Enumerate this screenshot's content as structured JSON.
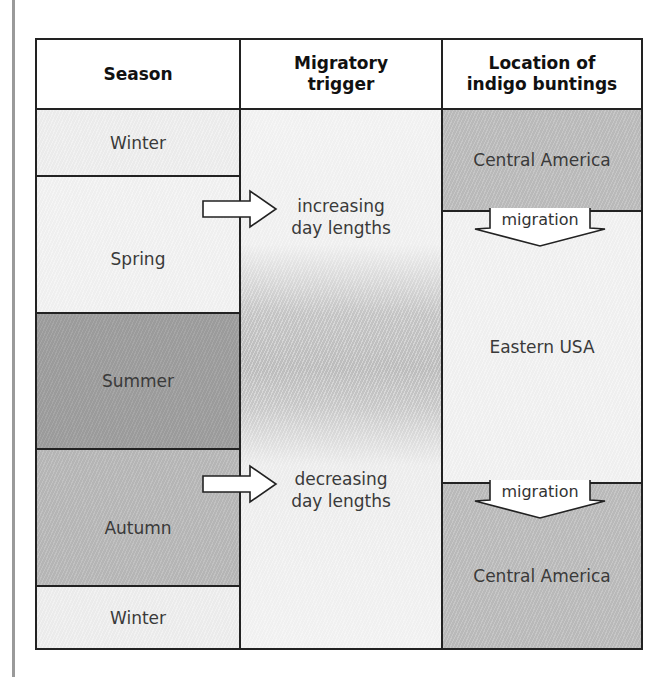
{
  "table": {
    "headers": [
      "Season",
      "Migratory trigger",
      "Location of indigo buntings"
    ],
    "header_lines": {
      "season": [
        "Season"
      ],
      "trigger": [
        "Migratory",
        "trigger"
      ],
      "location": [
        "Location of",
        "indigo buntings"
      ]
    },
    "seasons": [
      {
        "label": "Winter",
        "shade": "light"
      },
      {
        "label": "Spring",
        "shade": "very-light"
      },
      {
        "label": "Summer",
        "shade": "dark"
      },
      {
        "label": "Autumn",
        "shade": "mid"
      },
      {
        "label": "Winter",
        "shade": "light"
      }
    ],
    "triggers": [
      {
        "lines": [
          "increasing",
          "day lengths"
        ],
        "arrow_from": "Spring"
      },
      {
        "lines": [
          "decreasing",
          "day lengths"
        ],
        "arrow_from": "Autumn"
      }
    ],
    "locations": [
      {
        "label": "Central America",
        "shade": "mid"
      },
      {
        "label": "Eastern USA",
        "shade": "very-light"
      },
      {
        "label": "Central America",
        "shade": "mid"
      }
    ],
    "migration_arrows": [
      {
        "label": "migration",
        "from": "Central America",
        "to": "Eastern USA"
      },
      {
        "label": "migration",
        "from": "Eastern USA",
        "to": "Central America"
      }
    ]
  },
  "icons": {
    "trigger_arrow": "right-arrow-icon",
    "migration_arrow": "down-arrow-icon"
  }
}
